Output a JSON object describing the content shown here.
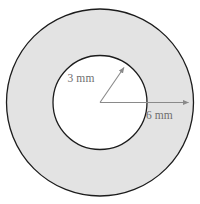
{
  "figure": {
    "name": "annulus-cross-section",
    "background_color": "#ffffff",
    "outline_color": "#1c1c1c",
    "ring_fill_color": "#e3e3e3",
    "hole_fill_color": "#ffffff",
    "leader_color": "#8a8a8a",
    "label_color": "#6e6e6e",
    "center": {
      "x": 100,
      "y": 102.5
    },
    "outer_circle": {
      "radius": 93.5
    },
    "inner_circle": {
      "radius": 47
    },
    "dimensions": [
      {
        "id": "inner-radius",
        "label": "3 mm",
        "value": 3,
        "unit": "mm",
        "measures": "inner-radius",
        "leader": {
          "x1": 100,
          "y1": 102.5,
          "x2": 124,
          "y2": 67.5
        },
        "label_position": {
          "x": 81,
          "y": 82
        },
        "arrowhead": "end"
      },
      {
        "id": "outer-radius",
        "label": "6 mm",
        "value": 6,
        "unit": "mm",
        "measures": "outer-radius",
        "leader": {
          "x1": 100,
          "y1": 102.5,
          "x2": 188.5,
          "y2": 102.5
        },
        "label_position": {
          "x": 146,
          "y": 119
        },
        "arrowhead": "end"
      }
    ]
  }
}
